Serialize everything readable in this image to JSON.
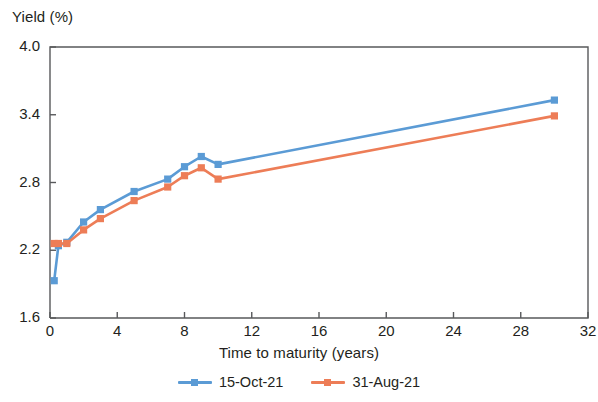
{
  "chart_data": {
    "type": "line",
    "title": "",
    "ylabel": "Yield (%)",
    "xlabel": "Time to maturity (years)",
    "xlim": [
      0,
      32
    ],
    "ylim": [
      1.6,
      4.0
    ],
    "xticks": [
      0,
      4,
      8,
      12,
      16,
      20,
      24,
      28,
      32
    ],
    "yticks": [
      1.6,
      2.2,
      2.8,
      3.4,
      4.0
    ],
    "xtick_labels": [
      "0",
      "4",
      "8",
      "12",
      "16",
      "20",
      "24",
      "28",
      "32"
    ],
    "ytick_labels": [
      "1.6",
      "2.2",
      "2.8",
      "3.4",
      "4.0"
    ],
    "grid": false,
    "legend_position": "bottom-center",
    "x": [
      0.25,
      0.5,
      1,
      2,
      3,
      5,
      7,
      8,
      9,
      10,
      30
    ],
    "series": [
      {
        "name": "15-Oct-21",
        "color": "#5b9bd5",
        "marker": "square",
        "values": [
          1.93,
          2.24,
          2.27,
          2.45,
          2.56,
          2.72,
          2.83,
          2.94,
          3.03,
          2.96,
          3.53
        ]
      },
      {
        "name": "31-Aug-21",
        "color": "#ed7d57",
        "marker": "square",
        "values": [
          2.26,
          2.26,
          2.26,
          2.38,
          2.48,
          2.64,
          2.76,
          2.86,
          2.93,
          2.83,
          3.39
        ]
      }
    ]
  },
  "axes": {
    "y_title": "Yield (%)",
    "x_title": "Time to maturity (years)",
    "y_ticks": [
      "4.0",
      "3.4",
      "2.8",
      "2.2",
      "1.6"
    ],
    "x_ticks": [
      "0",
      "4",
      "8",
      "12",
      "16",
      "20",
      "24",
      "28",
      "32"
    ]
  },
  "legend": {
    "items": [
      {
        "label": "15-Oct-21",
        "color": "#5b9bd5"
      },
      {
        "label": "31-Aug-21",
        "color": "#ed7d57"
      }
    ]
  },
  "colors": {
    "series_1": "#5b9bd5",
    "series_2": "#ed7d57",
    "axis": "#58595b",
    "text": "#231f20"
  }
}
